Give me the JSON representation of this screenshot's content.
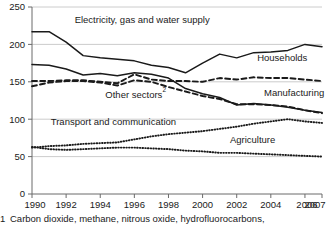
{
  "chart_data": {
    "type": "line",
    "title": "",
    "subtitle": "",
    "xlabel": "",
    "ylabel": "",
    "xlim": [
      1990,
      2007
    ],
    "ylim": [
      0,
      250
    ],
    "grid": true,
    "legend_position": "inline-labels",
    "x": [
      1990,
      1991,
      1992,
      1993,
      1994,
      1995,
      1996,
      1997,
      1998,
      1999,
      2000,
      2001,
      2002,
      2003,
      2004,
      2005,
      2006,
      2007
    ],
    "xticks": [
      "1990",
      "1992",
      "1994",
      "1996",
      "1998",
      "2000",
      "2002",
      "2004",
      "2006",
      "2007"
    ],
    "xtick_values": [
      1990,
      1992,
      1994,
      1996,
      1998,
      2000,
      2002,
      2004,
      2006,
      2007
    ],
    "yticks": [
      "0",
      "50",
      "100",
      "150",
      "200",
      "250"
    ],
    "ytick_values": [
      0,
      50,
      100,
      150,
      200,
      250
    ],
    "series": [
      {
        "name": "Electricity, gas and water supply",
        "style": "solid",
        "label": "Electricity, gas and water supply",
        "values": [
          217,
          217,
          203,
          185,
          182,
          180,
          178,
          172,
          169,
          162,
          175,
          187,
          182,
          189,
          190,
          192,
          200,
          197
        ]
      },
      {
        "name": "Manufacturing",
        "style": "solid",
        "label": "Manufacturing",
        "values": [
          173,
          172,
          167,
          159,
          161,
          158,
          162,
          160,
          155,
          141,
          134,
          129,
          119,
          121,
          119,
          116,
          112,
          109
        ]
      },
      {
        "name": "Households",
        "style": "dashed",
        "label": "Households",
        "values": [
          151,
          151,
          152,
          152,
          150,
          148,
          160,
          153,
          151,
          151,
          150,
          155,
          153,
          156,
          155,
          155,
          153,
          151
        ]
      },
      {
        "name": "Other sectors",
        "style": "dashed",
        "label": "Other sectors",
        "label_superscript": "2",
        "values": [
          144,
          149,
          151,
          151,
          149,
          145,
          152,
          150,
          143,
          137,
          131,
          127,
          120,
          120,
          119,
          117,
          112,
          108
        ]
      },
      {
        "name": "Transport and communication",
        "style": "dotted",
        "label": "Transport and communication",
        "values": [
          62,
          64,
          65,
          67,
          68,
          69,
          73,
          77,
          80,
          82,
          84,
          87,
          90,
          94,
          97,
          100,
          97,
          95
        ]
      },
      {
        "name": "Agriculture",
        "style": "dotted",
        "label": "Agriculture",
        "values": [
          63,
          60,
          59,
          60,
          61,
          62,
          62,
          61,
          60,
          58,
          57,
          55,
          55,
          54,
          53,
          52,
          51,
          50
        ]
      }
    ],
    "annotations": [
      {
        "text": "Electricity, gas and water supply",
        "x": 1992.5,
        "y": 228
      },
      {
        "text": "Households",
        "x": 2003.2,
        "y": 178
      },
      {
        "text": "Other sectors",
        "x": 1994.3,
        "y": 128,
        "superscript": "2"
      },
      {
        "text": "Manufacturing",
        "x": 2003.6,
        "y": 131
      },
      {
        "text": "Transport and communication",
        "x": 1991.1,
        "y": 92
      },
      {
        "text": "Agriculture",
        "x": 2001.6,
        "y": 68
      }
    ]
  },
  "footnote": {
    "marker": "1",
    "text": "Carbon dioxide, methane, nitrous oxide, hydrofluorocarbons,"
  },
  "colors": {
    "ink": "#1a1a1a",
    "grid": "#bfbfbf",
    "axis": "#6b6b6b",
    "background": "#ffffff"
  }
}
